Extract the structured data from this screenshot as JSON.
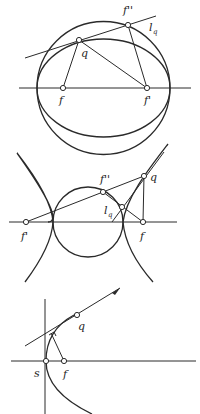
{
  "figures": [
    {
      "name": "ellipse-construction",
      "labels": {
        "f": "f",
        "f_prime": "f'",
        "f_double_prime": "f''",
        "q": "q",
        "l": "l",
        "l_sub": "q"
      }
    },
    {
      "name": "hyperbola-construction",
      "labels": {
        "f": "f",
        "f_prime": "f'",
        "f_double_prime": "f''",
        "q": "q",
        "l": "l",
        "l_sub": "q"
      }
    },
    {
      "name": "parabola-construction",
      "labels": {
        "s": "s",
        "f": "f",
        "q": "q"
      }
    }
  ],
  "colors": {
    "ink": "#2a2a2a",
    "background": "#ffffff"
  }
}
